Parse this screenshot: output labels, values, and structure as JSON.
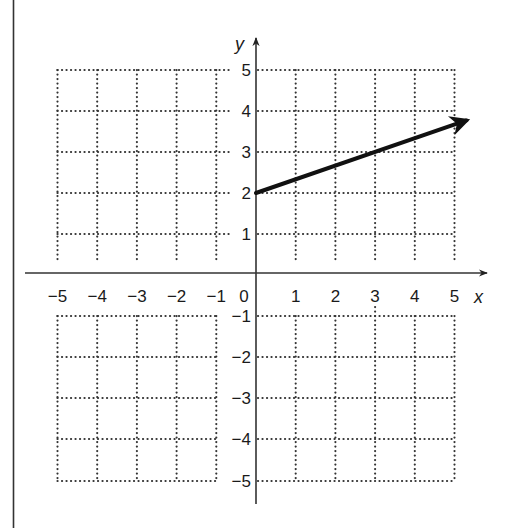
{
  "chart_data": {
    "type": "line",
    "title": "",
    "xlabel": "x",
    "ylabel": "y",
    "xlim": [
      -5,
      5
    ],
    "ylim": [
      -5,
      5
    ],
    "grid": true,
    "grid_style": "dotted",
    "x_ticks": [
      "−5",
      "−4",
      "−3",
      "−2",
      "−1",
      "0",
      "1",
      "2",
      "3",
      "4",
      "5"
    ],
    "y_ticks_positive": [
      "5",
      "4",
      "3",
      "2",
      "1"
    ],
    "y_ticks_negative": [
      "−1",
      "−2",
      "−3",
      "−4",
      "−5"
    ],
    "series": [
      {
        "name": "ray",
        "description": "Ray starting at (0, 2) with slope 1/3, arrow pointing toward upper right",
        "start": {
          "x": 0,
          "y": 2
        },
        "points": [
          {
            "x": 0,
            "y": 2
          },
          {
            "x": 3,
            "y": 3
          },
          {
            "x": 5.5,
            "y": 3.83
          }
        ],
        "slope": 0.3333,
        "y_intercept": 2,
        "color": "#111111",
        "end_marker": "arrow"
      }
    ]
  },
  "labels": {
    "x_axis": "x",
    "y_axis": "y",
    "origin": "0"
  }
}
